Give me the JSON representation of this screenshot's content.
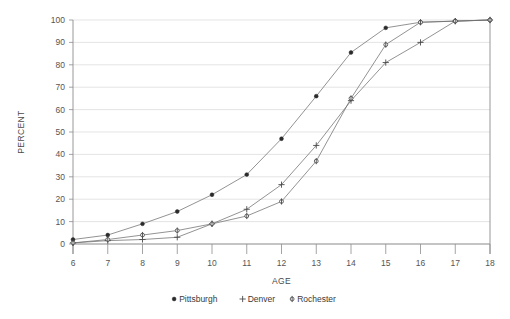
{
  "chart_data": {
    "type": "line",
    "title": "",
    "xlabel": "AGE",
    "ylabel": "PERCENT",
    "xlim": [
      6,
      18
    ],
    "ylim": [
      0,
      100
    ],
    "grid": true,
    "legend_position": "bottom",
    "x": [
      6,
      7,
      8,
      9,
      10,
      11,
      12,
      13,
      14,
      15,
      16,
      17,
      18
    ],
    "x_tick_labels": [
      "6",
      "7",
      "8",
      "9",
      "10",
      "11",
      "12",
      "13",
      "14",
      "15",
      "16",
      "17",
      "18"
    ],
    "y_tick_labels": [
      "0",
      "10",
      "20",
      "30",
      "40",
      "50",
      "60",
      "70",
      "80",
      "90",
      "100"
    ],
    "y_ticks": [
      0,
      10,
      20,
      30,
      40,
      50,
      60,
      70,
      80,
      90,
      100
    ],
    "series": [
      {
        "name": "Pittsburgh",
        "marker": "filled-circle",
        "values": [
          2,
          4,
          9,
          14.5,
          22,
          31,
          47,
          66,
          85.5,
          96.5,
          99,
          99.5,
          100
        ]
      },
      {
        "name": "Denver",
        "marker": "plus",
        "values": [
          0.5,
          1.5,
          2,
          3,
          9,
          15.5,
          26.5,
          44,
          64,
          81,
          90,
          99.5,
          100
        ]
      },
      {
        "name": "Rochester",
        "marker": "open-circle",
        "values": [
          0.5,
          2,
          4,
          6,
          9,
          12.5,
          19,
          37,
          65,
          89,
          99,
          99.5,
          100
        ]
      }
    ]
  },
  "legend": {
    "items": [
      {
        "label": "Pittsburgh",
        "marker": "filled-circle"
      },
      {
        "label": "Denver",
        "marker": "plus"
      },
      {
        "label": "Rochester",
        "marker": "open-circle"
      }
    ]
  },
  "colors": {
    "line": "#6f6f6f",
    "marker_dark": "#2b2b2b",
    "grid": "#d8d8d8",
    "axis": "#8d8d8d",
    "text": "#3a3a3a",
    "background": "#ffffff"
  }
}
